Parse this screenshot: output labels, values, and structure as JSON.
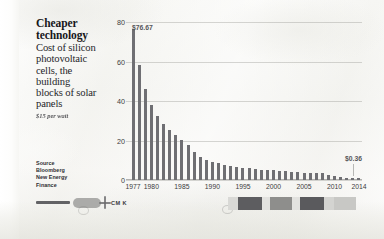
{
  "headline": {
    "line1": "Cheaper",
    "line2": "technology"
  },
  "deck": "Cost of silicon photovoltaic cells, the building blocks of solar panels",
  "unit_note": "$15 per watt",
  "source": {
    "label": "Source",
    "line1": "Bloomberg",
    "line2": "New Energy",
    "line3": "Finance"
  },
  "annotations": {
    "max_label": "$76.67",
    "min_label": "$0.36"
  },
  "footer_artifacts": {
    "cmk": "CM K"
  },
  "colors": {
    "bar": "#6f6f73",
    "text": "#17171a",
    "gridline": "#969691",
    "paper": "#f4f4f0"
  },
  "chart_data": {
    "type": "bar",
    "title": "Cheaper technology",
    "subtitle": "Cost of silicon photovoltaic cells, the building blocks of solar panels",
    "xlabel": "",
    "ylabel": "$ per watt",
    "ylim": [
      0,
      80
    ],
    "yticks": [
      0,
      20,
      40,
      60,
      80
    ],
    "xticks": [
      "1977",
      "1980",
      "1985",
      "1990",
      "1995",
      "2000",
      "2005",
      "2010",
      "2014"
    ],
    "grid": true,
    "legend": null,
    "categories": [
      "1977",
      "1978",
      "1979",
      "1980",
      "1981",
      "1982",
      "1983",
      "1984",
      "1985",
      "1986",
      "1987",
      "1988",
      "1989",
      "1990",
      "1991",
      "1992",
      "1993",
      "1994",
      "1995",
      "1996",
      "1997",
      "1998",
      "1999",
      "2000",
      "2001",
      "2002",
      "2003",
      "2004",
      "2005",
      "2006",
      "2007",
      "2008",
      "2009",
      "2010",
      "2011",
      "2012",
      "2013",
      "2014"
    ],
    "values": [
      76.67,
      58.0,
      46.0,
      38.0,
      32.5,
      28.5,
      25.5,
      23.0,
      20.5,
      17.5,
      14.0,
      11.5,
      10.0,
      9.2,
      8.5,
      7.8,
      7.2,
      6.8,
      6.3,
      5.9,
      5.6,
      5.3,
      5.1,
      4.9,
      4.7,
      4.5,
      4.2,
      3.9,
      3.6,
      3.4,
      3.3,
      3.5,
      2.4,
      1.9,
      1.3,
      0.9,
      0.6,
      0.36
    ],
    "annotations": [
      {
        "category": "1977",
        "value": 76.67,
        "text": "$76.67"
      },
      {
        "category": "2014",
        "value": 0.36,
        "text": "$0.36"
      }
    ]
  }
}
